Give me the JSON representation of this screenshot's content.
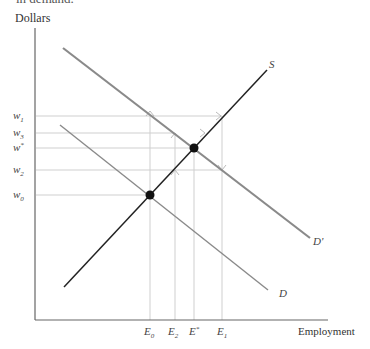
{
  "caption_fragment": "in demand.",
  "y_axis_label": "Dollars",
  "x_axis_label": "Employment",
  "curves": {
    "supply": {
      "label": "S",
      "color": "#222222"
    },
    "demand_original": {
      "label": "D",
      "color": "#888888"
    },
    "demand_shifted": {
      "label": "D'",
      "color": "#888888"
    }
  },
  "wage_levels": [
    {
      "id": "w1",
      "base": "w",
      "sub": "1"
    },
    {
      "id": "w3",
      "base": "w",
      "sub": "3"
    },
    {
      "id": "wstar",
      "base": "w",
      "sub": "*"
    },
    {
      "id": "w2",
      "base": "w",
      "sub": "2"
    },
    {
      "id": "w0",
      "base": "w",
      "sub": "0"
    }
  ],
  "employment_levels": [
    {
      "id": "E0",
      "base": "E",
      "sub": "0"
    },
    {
      "id": "E2",
      "base": "E",
      "sub": "2"
    },
    {
      "id": "Estar",
      "base": "E",
      "sub": "*"
    },
    {
      "id": "E1",
      "base": "E",
      "sub": "1"
    }
  ],
  "equilibria": [
    {
      "name": "initial",
      "wage": "w0",
      "employment": "E0"
    },
    {
      "name": "new",
      "wage": "wstar",
      "employment": "Estar"
    }
  ],
  "colors": {
    "axis": "#666666",
    "guide": "#cccccc",
    "point": "#111111"
  }
}
